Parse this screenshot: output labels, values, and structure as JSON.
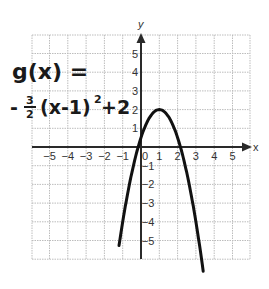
{
  "graph": {
    "function_label_line1": "g(x) =",
    "function_label_line2": "-³⁄₂(x-1)²+2",
    "function": {
      "name": "g",
      "expression": "-3/2(x-1)^2+2",
      "a": -1.5,
      "h": 1,
      "k": 2,
      "vertex": [
        1,
        2
      ]
    },
    "x_axis_label": "x",
    "y_axis_label": "y",
    "x_ticks": [
      "-5",
      "-4",
      "-3",
      "-2",
      "-1",
      "0",
      "1",
      "2",
      "3",
      "4",
      "5"
    ],
    "y_ticks": [
      "5",
      "4",
      "3",
      "2",
      "1",
      "-1",
      "-2",
      "-3",
      "-4",
      "-5"
    ],
    "x_range": [
      -6,
      6
    ],
    "y_range": [
      -6,
      6
    ],
    "grid": true,
    "colors": {
      "grid": "#bdbdbd",
      "axis": "#2a2a2a",
      "curve": "#111111",
      "ink": "#1a1a1a"
    }
  },
  "chart_data": {
    "type": "line",
    "xlabel": "x",
    "ylabel": "y",
    "xlim": [
      -6,
      6
    ],
    "ylim": [
      -6,
      6
    ],
    "grid": true,
    "x_tick_labels": [
      "-5",
      "-4",
      "-3",
      "-2",
      "-1",
      "0",
      "1",
      "2",
      "3",
      "4",
      "5"
    ],
    "y_tick_labels": [
      "-5",
      "-4",
      "-3",
      "-2",
      "-1",
      "1",
      "2",
      "3",
      "4",
      "5"
    ],
    "series": [
      {
        "name": "g(x)",
        "x": [
          -1.2,
          -1,
          -0.5,
          0,
          0.5,
          1,
          1.5,
          2,
          2.5,
          3,
          3.5
        ],
        "values": [
          -5.3,
          -4,
          -1.4,
          0.5,
          1.6,
          2,
          1.6,
          0.5,
          -1.4,
          -4,
          -7.4
        ]
      }
    ],
    "annotations": [
      "vertex (1, 2)"
    ]
  }
}
